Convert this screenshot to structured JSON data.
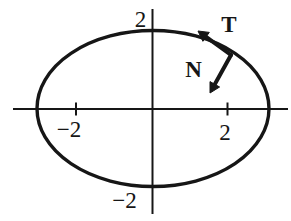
{
  "figure": {
    "background_color": "#ffffff",
    "ink_color": "#161616",
    "ellipse": {
      "x_extent_units": 3,
      "y_extent_units": 2
    },
    "labels": {
      "y_axis_top": "2",
      "y_axis_bottom": "−2",
      "x_axis_left": "−2",
      "x_axis_right": "2",
      "tangent_vector": "T",
      "normal_vector": "N"
    }
  }
}
